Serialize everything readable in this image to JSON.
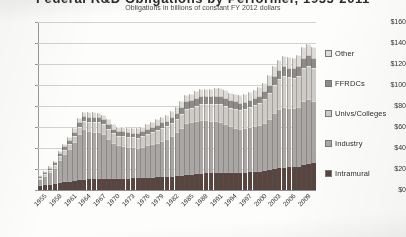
{
  "chart_data": {
    "type": "bar",
    "stacked": true,
    "title": "Federal R&D Obligations by Performer, 1955-2011",
    "subtitle": "Obligations in billions of constant FY 2012 dollars",
    "xlabel": "",
    "ylabel": "",
    "ylim": [
      0,
      160
    ],
    "ytick_step": 20,
    "ytick_labels": [
      "$160",
      "$140",
      "$120",
      "$100",
      "$80",
      "$60",
      "$40",
      "$20",
      "$0"
    ],
    "ytick_values": [
      160,
      140,
      120,
      100,
      80,
      60,
      40,
      20,
      0
    ],
    "grid": true,
    "legend_position": "right",
    "xtick_interval": 3,
    "xtick_labels": [
      "1955",
      "1958",
      "1961",
      "1964",
      "1967",
      "1970",
      "1973",
      "1976",
      "1979",
      "1982",
      "1985",
      "1988",
      "1991",
      "1994",
      "1997",
      "2000",
      "2003",
      "2006",
      "2009"
    ],
    "categories": [
      "1955",
      "1956",
      "1957",
      "1958",
      "1959",
      "1960",
      "1961",
      "1962",
      "1963",
      "1964",
      "1965",
      "1966",
      "1967",
      "1968",
      "1969",
      "1970",
      "1971",
      "1972",
      "1973",
      "1974",
      "1975",
      "1976",
      "1977",
      "1978",
      "1979",
      "1980",
      "1981",
      "1982",
      "1983",
      "1984",
      "1985",
      "1986",
      "1987",
      "1988",
      "1989",
      "1990",
      "1991",
      "1992",
      "1993",
      "1994",
      "1995",
      "1996",
      "1997",
      "1998",
      "1999",
      "2000",
      "2001",
      "2002",
      "2003",
      "2004",
      "2005",
      "2006",
      "2007",
      "2008",
      "2009",
      "2010",
      "2011"
    ],
    "series": [
      {
        "name": "Intramural",
        "color": "#584540",
        "values": [
          5.0,
          5.6,
          6.2,
          6.8,
          7.6,
          8.3,
          9.0,
          9.6,
          10.2,
          10.8,
          11.2,
          11.6,
          11.8,
          11.9,
          11.8,
          11.6,
          11.5,
          11.7,
          11.9,
          12.0,
          12.0,
          12.2,
          12.5,
          12.8,
          13.1,
          13.3,
          13.2,
          13.4,
          13.9,
          14.4,
          15.1,
          15.4,
          16.0,
          16.6,
          16.8,
          17.0,
          17.4,
          17.6,
          17.6,
          17.5,
          17.4,
          17.3,
          17.5,
          17.8,
          18.2,
          18.5,
          19.0,
          20.0,
          21.2,
          21.9,
          22.3,
          22.4,
          22.6,
          23.0,
          24.5,
          26.0,
          26.8
        ]
      },
      {
        "name": "Industry",
        "color": "#a9a6a3",
        "values": [
          5.5,
          8.0,
          11.0,
          14.5,
          21.0,
          26.0,
          30.0,
          36.0,
          43.0,
          47.0,
          45.0,
          44.0,
          43.0,
          41.0,
          37.0,
          33.0,
          31.0,
          30.5,
          29.5,
          28.5,
          28.0,
          29.0,
          30.0,
          31.0,
          32.0,
          33.5,
          35.5,
          38.5,
          41.5,
          45.0,
          49.0,
          49.0,
          50.0,
          50.5,
          49.5,
          48.5,
          48.0,
          47.0,
          45.0,
          43.0,
          42.0,
          41.0,
          41.5,
          42.0,
          42.5,
          43.0,
          45.0,
          48.0,
          52.0,
          55.0,
          57.0,
          56.0,
          55.5,
          56.5,
          60.0,
          60.5,
          58.0
        ]
      },
      {
        "name": "Univs/Colleges",
        "color": "#cecbc7",
        "values": [
          1.2,
          1.6,
          2.1,
          2.7,
          3.4,
          4.2,
          5.0,
          5.9,
          6.9,
          7.8,
          8.6,
          9.2,
          9.6,
          9.7,
          9.5,
          9.4,
          9.4,
          9.5,
          9.5,
          9.6,
          9.8,
          10.2,
          10.8,
          11.4,
          11.9,
          12.2,
          12.0,
          11.9,
          12.2,
          12.8,
          13.5,
          13.8,
          14.4,
          15.0,
          15.5,
          16.0,
          16.6,
          17.2,
          17.5,
          17.6,
          17.8,
          17.9,
          18.3,
          19.0,
          20.0,
          21.0,
          22.5,
          24.5,
          27.0,
          28.5,
          29.5,
          29.0,
          29.0,
          29.5,
          31.5,
          32.0,
          31.0
        ]
      },
      {
        "name": "FFRDCs",
        "color": "#8e8b88",
        "values": [
          1.5,
          1.8,
          2.1,
          2.4,
          2.8,
          3.2,
          3.6,
          4.0,
          4.5,
          4.9,
          5.0,
          5.0,
          5.0,
          4.9,
          4.7,
          4.5,
          4.4,
          4.4,
          4.4,
          4.4,
          4.5,
          4.6,
          4.8,
          5.0,
          5.2,
          5.4,
          5.5,
          5.8,
          6.2,
          6.6,
          7.0,
          7.2,
          7.5,
          7.8,
          7.9,
          7.9,
          7.9,
          7.8,
          7.6,
          7.4,
          7.2,
          7.0,
          7.0,
          7.1,
          7.2,
          7.3,
          7.6,
          8.0,
          8.6,
          9.0,
          9.2,
          9.1,
          9.0,
          9.2,
          9.8,
          10.0,
          9.8
        ]
      },
      {
        "name": "Other",
        "color": "#dedbd6",
        "values": [
          1.0,
          1.2,
          1.4,
          1.7,
          2.0,
          2.4,
          2.8,
          3.2,
          3.7,
          4.1,
          4.3,
          4.4,
          4.4,
          4.4,
          4.3,
          4.2,
          4.2,
          4.2,
          4.2,
          4.3,
          4.4,
          4.5,
          4.7,
          4.9,
          5.1,
          5.2,
          5.2,
          5.3,
          5.5,
          5.8,
          6.1,
          6.2,
          6.5,
          6.8,
          6.9,
          7.0,
          7.2,
          7.3,
          7.3,
          7.3,
          7.2,
          7.1,
          7.2,
          7.4,
          7.6,
          7.9,
          8.2,
          8.7,
          9.3,
          9.7,
          9.9,
          9.8,
          9.8,
          10.0,
          10.6,
          11.0,
          10.7
        ]
      }
    ],
    "totals": [
      14.2,
      18.2,
      22.8,
      28.1,
      36.8,
      44.1,
      50.4,
      58.7,
      68.3,
      74.6,
      74.1,
      74.2,
      73.8,
      71.9,
      67.3,
      62.7,
      60.5,
      60.3,
      59.5,
      58.8,
      58.7,
      60.5,
      62.8,
      65.1,
      67.3,
      69.6,
      71.4,
      74.9,
      79.3,
      84.6,
      90.7,
      91.6,
      94.4,
      96.7,
      96.6,
      96.4,
      97.1,
      96.9,
      95.0,
      92.8,
      91.6,
      90.3,
      91.5,
      93.3,
      95.5,
      97.7,
      102.3,
      109.2,
      118.1,
      124.1,
      127.9,
      126.3,
      125.9,
      128.2,
      136.4,
      139.5,
      136.3
    ]
  },
  "legend": {
    "items": [
      {
        "label": "Other",
        "swatch_name": "legend-swatch-other"
      },
      {
        "label": "FFRDCs",
        "swatch_name": "legend-swatch-ffrdcs"
      },
      {
        "label": "Univs/Colleges",
        "swatch_name": "legend-swatch-univs-colleges"
      },
      {
        "label": "Industry",
        "swatch_name": "legend-swatch-industry"
      },
      {
        "label": "Intramural",
        "swatch_name": "legend-swatch-intramural"
      }
    ]
  }
}
